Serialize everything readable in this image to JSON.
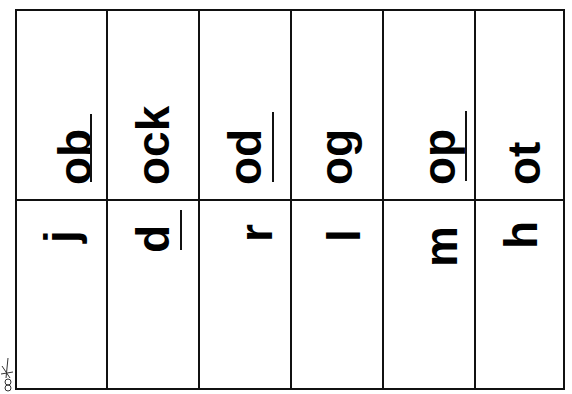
{
  "worksheet": {
    "title": "Word family cut-apart cards",
    "columns": [
      {
        "ending": "ob",
        "ending_underlined": true,
        "onset": "j",
        "onset_underlined": false
      },
      {
        "ending": "ock",
        "ending_underlined": false,
        "onset": "d",
        "onset_underlined": true
      },
      {
        "ending": "od",
        "ending_underlined": true,
        "onset": "r",
        "onset_underlined": false
      },
      {
        "ending": "og",
        "ending_underlined": false,
        "onset": "l",
        "onset_underlined": false
      },
      {
        "ending": "op",
        "ending_underlined": true,
        "onset": "m",
        "onset_underlined": false
      },
      {
        "ending": "ot",
        "ending_underlined": false,
        "onset": "h",
        "onset_underlined": false
      }
    ],
    "cut_marker": "scissors-icon",
    "colors": {
      "ink": "#000000",
      "border": "#111111",
      "background": "#ffffff"
    }
  }
}
